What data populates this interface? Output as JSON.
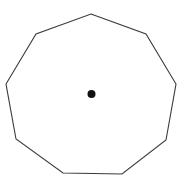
{
  "figure": {
    "background_color": "#ffffff",
    "width": 188,
    "height": 186,
    "shape": {
      "name": "nonagon",
      "sides": 9,
      "fill": "none",
      "stroke_color": "#3a3a3a",
      "stroke_width": 1.1,
      "vertices": [
        [
          91,
          14
        ],
        [
          146,
          34
        ],
        [
          176,
          84
        ],
        [
          166,
          140
        ],
        [
          122,
          174
        ],
        [
          63,
          173
        ],
        [
          16,
          139
        ],
        [
          6,
          84
        ],
        [
          36,
          34
        ]
      ],
      "points_attr": "91,14 146,34 176,84 166,140 122,174 63,173 16,139 6,84 36,34"
    },
    "center_point": {
      "name": "center-dot",
      "x": 91.5,
      "y": 94,
      "radius": 4,
      "color": "#111111"
    }
  }
}
